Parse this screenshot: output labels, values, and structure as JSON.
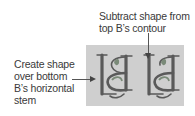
{
  "annotations": {
    "top": {
      "lines": [
        "Subtract shape from",
        "top B’s contour"
      ]
    },
    "left": {
      "lines": [
        "Create shape",
        "over bottom",
        "B’s horizontal",
        "stem"
      ]
    }
  },
  "figure": {
    "background_color": "#cfcfcf",
    "glyph_color": "#5a5a5a",
    "accent_color": "#7a8a78",
    "glyphs": [
      {
        "id": "monogram-left",
        "description": "L and mirrored B monogram, bottom stem shape added"
      },
      {
        "id": "monogram-right",
        "description": "L and mirrored B monogram, top contour subtracted"
      }
    ]
  }
}
